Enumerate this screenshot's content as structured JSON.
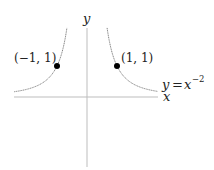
{
  "chart_data": {
    "type": "line",
    "title": "",
    "function": "y = x^-2",
    "xlabel": "x",
    "ylabel": "y",
    "curve_label": "y = x^{-2}",
    "xlim": [
      -2.45,
      2.4
    ],
    "ylim": [
      -2.25,
      2.25
    ],
    "grid": false,
    "legend": "none",
    "series": [
      {
        "name": "y = x^-2 (left branch)",
        "x": [
          -2.43,
          -2.0,
          -1.5,
          -1.2,
          -1.0,
          -0.85,
          -0.75,
          -0.67
        ],
        "y": [
          0.17,
          0.25,
          0.44,
          0.69,
          1.0,
          1.38,
          1.78,
          2.23
        ]
      },
      {
        "name": "y = x^-2 (right branch)",
        "x": [
          0.67,
          0.75,
          0.85,
          1.0,
          1.2,
          1.5,
          2.0,
          2.35
        ],
        "y": [
          2.23,
          1.78,
          1.38,
          1.0,
          0.69,
          0.44,
          0.25,
          0.18
        ]
      }
    ],
    "points": [
      {
        "x": -1,
        "y": 1,
        "label": "(−1, 1)"
      },
      {
        "x": 1,
        "y": 1,
        "label": "(1, 1)"
      }
    ]
  },
  "labels": {
    "y_axis": "y",
    "x_axis": "x",
    "curve_y": "y",
    "curve_eq": "=",
    "curve_x": "x",
    "curve_exp": "−2",
    "point_left": "(−1, 1)",
    "point_right": "(1, 1)"
  },
  "colors": {
    "axis": "#b8b8b8",
    "curve": "#777777",
    "point": "#000000",
    "text": "#222222"
  }
}
